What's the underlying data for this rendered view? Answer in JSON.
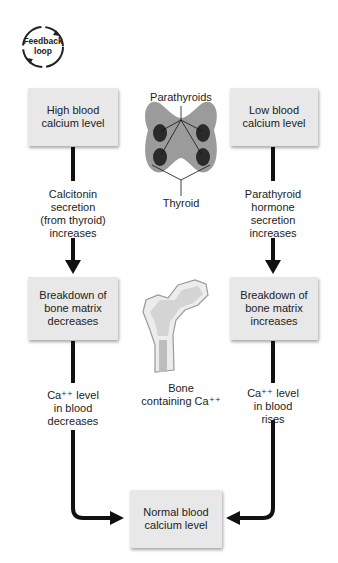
{
  "feedback_badge": {
    "line1": "Feedback",
    "line2": "loop"
  },
  "left_column": {
    "start_box": "High blood calcium level",
    "step1": [
      "Calcitonin",
      "secretion",
      "(from thyroid)",
      "increases"
    ],
    "middle_box": [
      "Breakdown of",
      "bone matrix",
      "decreases"
    ],
    "step2": [
      "Ca⁺⁺ level",
      "in blood",
      "decreases"
    ]
  },
  "right_column": {
    "start_box": "Low blood calcium level",
    "step1": [
      "Parathyroid",
      "hormone",
      "secretion",
      "increases"
    ],
    "middle_box": [
      "Breakdown of",
      "bone matrix",
      "increases"
    ],
    "step2": [
      "Ca⁺⁺ level",
      "in blood",
      "rises"
    ]
  },
  "center": {
    "parathyroids_label": "Parathyroids",
    "thyroid_label": "Thyroid",
    "bone_label": [
      "Bone",
      "containing Ca⁺⁺"
    ]
  },
  "end_box": [
    "Normal blood",
    "calcium level"
  ]
}
